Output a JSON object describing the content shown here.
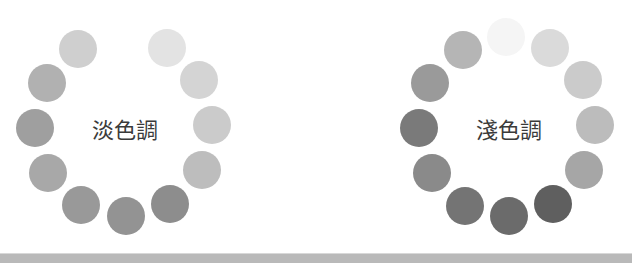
{
  "panels": [
    {
      "label": "淡色調",
      "label_pos": [
        125,
        128
      ],
      "dots": [
        {
          "x": 78,
          "y": 49,
          "color": "#cfcfcf"
        },
        {
          "x": 167,
          "y": 48,
          "color": "#e3e3e3"
        },
        {
          "x": 199,
          "y": 80,
          "color": "#d4d4d4"
        },
        {
          "x": 212,
          "y": 125,
          "color": "#cbcbcb"
        },
        {
          "x": 202,
          "y": 170,
          "color": "#bdbdbd"
        },
        {
          "x": 170,
          "y": 204,
          "color": "#8d8d8d"
        },
        {
          "x": 126,
          "y": 216,
          "color": "#939393"
        },
        {
          "x": 81,
          "y": 205,
          "color": "#999999"
        },
        {
          "x": 48,
          "y": 173,
          "color": "#a8a8a8"
        },
        {
          "x": 35,
          "y": 128,
          "color": "#9f9f9f"
        },
        {
          "x": 47,
          "y": 83,
          "color": "#b1b1b1"
        }
      ]
    },
    {
      "label": "淺色調",
      "label_pos": [
        509,
        128
      ],
      "dots": [
        {
          "x": 506,
          "y": 37,
          "color": "#f5f5f5"
        },
        {
          "x": 550,
          "y": 48,
          "color": "#dadada"
        },
        {
          "x": 583,
          "y": 80,
          "color": "#cbcbcb"
        },
        {
          "x": 595,
          "y": 125,
          "color": "#bcbcbc"
        },
        {
          "x": 584,
          "y": 170,
          "color": "#a6a6a6"
        },
        {
          "x": 553,
          "y": 204,
          "color": "#5f5f5f"
        },
        {
          "x": 509,
          "y": 216,
          "color": "#6b6b6b"
        },
        {
          "x": 465,
          "y": 206,
          "color": "#747474"
        },
        {
          "x": 432,
          "y": 173,
          "color": "#8a8a8a"
        },
        {
          "x": 419,
          "y": 128,
          "color": "#7a7a7a"
        },
        {
          "x": 430,
          "y": 83,
          "color": "#9a9a9a"
        },
        {
          "x": 463,
          "y": 50,
          "color": "#b5b5b5"
        }
      ]
    }
  ],
  "bottom_band_color": "#b9b9b9"
}
